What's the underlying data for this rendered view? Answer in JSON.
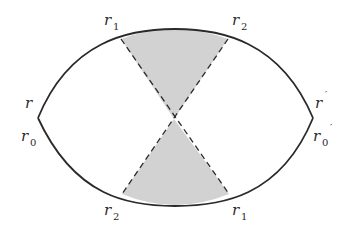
{
  "diagram": {
    "colors": {
      "stroke": "#2a2a2a",
      "shade": "#d0d0d0",
      "background": "#ffffff"
    },
    "shape": "lens bounded by two circular arcs meeting at left and right vertices",
    "regions": [
      {
        "name": "top-shaded-sector",
        "between": [
          "r1 (top)",
          "r2 (top)"
        ]
      },
      {
        "name": "bottom-shaded-sector",
        "between": [
          "r2 (bottom)",
          "r1 (bottom)"
        ]
      }
    ],
    "labels": {
      "top_left": {
        "base": "r",
        "sub": "1"
      },
      "top_right": {
        "base": "r",
        "sub": "2"
      },
      "left_upper": {
        "base": "r",
        "sub": ""
      },
      "left_lower": {
        "base": "r",
        "sub": "0"
      },
      "right_upper": {
        "base": "r",
        "sub": "",
        "prime": "′"
      },
      "right_lower": {
        "base": "r",
        "sub": "0",
        "prime": "′"
      },
      "bottom_left": {
        "base": "r",
        "sub": "2"
      },
      "bottom_right": {
        "base": "r",
        "sub": "1"
      }
    }
  }
}
